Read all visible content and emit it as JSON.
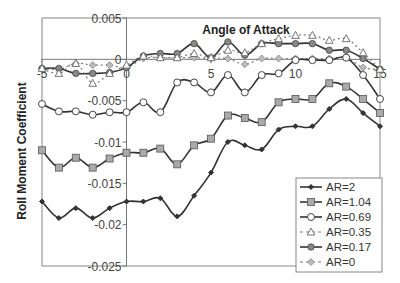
{
  "chart_data": {
    "type": "line",
    "title": "",
    "xlabel": "Angle of Attack",
    "ylabel": "Roll Moment Coefficient",
    "xlim": [
      -5,
      15
    ],
    "ylim": [
      -0.025,
      0.005
    ],
    "x_ticks": [
      "-5",
      "0",
      "5",
      "10",
      "15"
    ],
    "y_ticks": [
      "0.005",
      "0",
      "-0.005",
      "-0.01",
      "-0.015",
      "-0.02",
      "-0.025"
    ],
    "grid": false,
    "legend_position": "lower right",
    "x": [
      -5,
      -4,
      -3,
      -2,
      -1,
      0,
      1,
      2,
      3,
      4,
      5,
      6,
      7,
      8,
      9,
      10,
      11,
      12,
      13,
      14,
      15
    ],
    "series": [
      {
        "name": "AR=2",
        "marker": "small-diamond",
        "line": "solid",
        "color": "#333333",
        "values": [
          -0.0172,
          -0.0192,
          -0.018,
          -0.0192,
          -0.018,
          -0.0172,
          -0.0172,
          -0.0168,
          -0.019,
          -0.0165,
          -0.0137,
          -0.01,
          -0.0104,
          -0.0109,
          -0.0085,
          -0.0081,
          -0.0081,
          -0.006,
          -0.0048,
          -0.0065,
          -0.0081
        ]
      },
      {
        "name": "AR=1.04",
        "marker": "square",
        "line": "solid",
        "color": "#444444",
        "values": [
          -0.011,
          -0.0131,
          -0.0119,
          -0.0131,
          -0.012,
          -0.0113,
          -0.0113,
          -0.0108,
          -0.0127,
          -0.0104,
          -0.0096,
          -0.0068,
          -0.0071,
          -0.0076,
          -0.0052,
          -0.0048,
          -0.0048,
          -0.0029,
          -0.0033,
          -0.0048,
          -0.0065
        ]
      },
      {
        "name": "AR=0.69",
        "marker": "circle",
        "line": "solid",
        "color": "#444444",
        "values": [
          -0.0054,
          -0.0063,
          -0.0063,
          -0.0067,
          -0.0064,
          -0.0064,
          -0.0052,
          -0.0064,
          -0.0028,
          -0.0028,
          -0.004,
          -0.0019,
          -0.004,
          -0.0019,
          -0.0017,
          -0.0001,
          -0.0001,
          -0.0001,
          0.0002,
          -0.0019,
          -0.0048
        ]
      },
      {
        "name": "AR=0.35",
        "marker": "triangle",
        "line": "dashed",
        "color": "#666666",
        "values": [
          -0.0011,
          -0.0017,
          -0.0005,
          -0.0029,
          -0.0017,
          -0.0007,
          0.0004,
          0.0002,
          0.0002,
          0.0007,
          0.0002,
          0.0011,
          0.0008,
          0.0019,
          0.0025,
          0.0029,
          0.0029,
          0.0023,
          0.0025,
          0.0008,
          -0.0012
        ]
      },
      {
        "name": "AR=0.17",
        "marker": "diamond",
        "line": "solid",
        "color": "#333333",
        "values": [
          -0.0011,
          -0.0011,
          -0.0017,
          -0.0017,
          -0.0016,
          -0.001,
          0.0004,
          0.0007,
          0.0007,
          0.0019,
          0.0002,
          0.0021,
          0.0005,
          0.0019,
          0.0019,
          0.0019,
          0.0019,
          0.0011,
          0.0011,
          0.0001,
          -0.0012
        ]
      },
      {
        "name": "AR=0",
        "marker": "diamond-gray",
        "line": "dashed",
        "color": "#777777",
        "values": [
          -0.0011,
          -0.0012,
          -0.0005,
          -0.0007,
          -0.0007,
          -0.001,
          0.0001,
          0.0002,
          0.0002,
          0.0002,
          0.0001,
          0.0001,
          -0.0006,
          0.0001,
          0.0001,
          0.0001,
          0.0001,
          0.0001,
          0.0002,
          -0.001,
          -0.0012
        ]
      }
    ]
  }
}
